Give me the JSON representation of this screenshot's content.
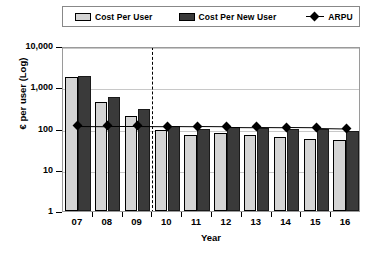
{
  "chart_data": {
    "type": "bar",
    "title": "",
    "xlabel": "Year",
    "ylabel": "€ per user (Log)",
    "categories": [
      "07",
      "08",
      "09",
      "10",
      "11",
      "12",
      "13",
      "14",
      "15",
      "16"
    ],
    "yscale": "log",
    "ylim": [
      1,
      10000
    ],
    "yticks": [
      1,
      10,
      100,
      1000,
      10000
    ],
    "ytick_labels": [
      "1",
      "10",
      "100",
      "1,000",
      "10,000"
    ],
    "grid": true,
    "legend_position": "top",
    "series": [
      {
        "name": "Cost Per User",
        "type": "bar",
        "color": "#d4d4d4",
        "values": [
          1800,
          450,
          200,
          90,
          70,
          78,
          70,
          62,
          55,
          52
        ]
      },
      {
        "name": "Cost Per New User",
        "type": "bar",
        "color": "#3a3a3a",
        "values": [
          1900,
          580,
          300,
          118,
          100,
          108,
          105,
          100,
          98,
          88
        ]
      },
      {
        "name": "ARPU",
        "type": "line",
        "color": "#000000",
        "marker": "diamond",
        "values": [
          132,
          130,
          130,
          128,
          126,
          124,
          122,
          120,
          118,
          115
        ]
      }
    ],
    "annotations": [
      {
        "type": "vertical-dashed-line",
        "label": "forecast-divider",
        "position_between": [
          "09",
          "10"
        ]
      }
    ]
  },
  "legend": {
    "items": [
      {
        "label": "Cost Per User",
        "marker": "swatch-light"
      },
      {
        "label": "Cost Per New User",
        "marker": "swatch-dark"
      },
      {
        "label": "ARPU",
        "marker": "diamond-line"
      }
    ]
  }
}
